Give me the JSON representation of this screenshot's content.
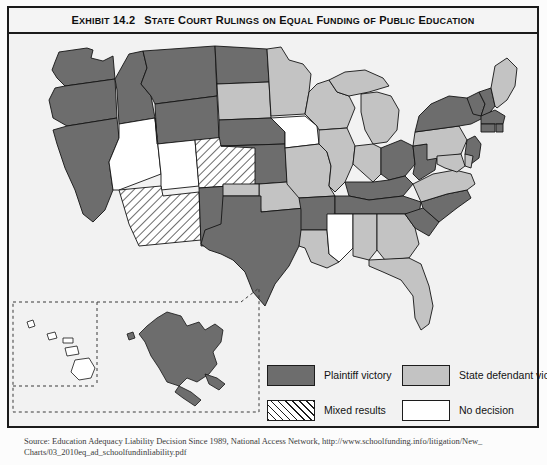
{
  "exhibit": {
    "number_label": "Exhibit 14.2",
    "title": "State Court Rulings on Equal Funding of Public Education"
  },
  "legend": {
    "items": [
      {
        "key": "plaintiff",
        "label": "Plaintiff victory",
        "style": "solid-dark",
        "color": "#6d6d6d"
      },
      {
        "key": "state_defendant",
        "label": "State defendant victory",
        "style": "solid-light",
        "color": "#c3c3c3"
      },
      {
        "key": "mixed",
        "label": "Mixed results",
        "style": "hatched",
        "color": "#ffffff"
      },
      {
        "key": "no_decision",
        "label": "No decision",
        "style": "solid-white",
        "color": "#ffffff"
      }
    ]
  },
  "source": {
    "line1": "Source: Education Adequacy Liability Decision Since 1989, National Access Network, http://www.schoolfunding.info/litigation/New_",
    "line2": "Charts/03_2010eq_ad_schoolfundinliability.pdf"
  },
  "chart_data": {
    "type": "map",
    "title": "State Court Rulings on Equal Funding of Public Education",
    "categories": [
      "Plaintiff victory",
      "State defendant victory",
      "Mixed results",
      "No decision"
    ],
    "category_colors": {
      "Plaintiff victory": "#6d6d6d",
      "State defendant victory": "#c3c3c3",
      "Mixed results": "#ffffff",
      "No decision": "#ffffff"
    },
    "values": {
      "WA": "Plaintiff victory",
      "OR": "Plaintiff victory",
      "CA": "Plaintiff victory",
      "ID": "Plaintiff victory",
      "MT": "Plaintiff victory",
      "WY": "Plaintiff victory",
      "NV": "No decision",
      "UT": "No decision",
      "AZ": "Mixed results",
      "CO": "Mixed results",
      "NM": "Plaintiff victory",
      "ND": "Plaintiff victory",
      "SD": "State defendant victory",
      "NE": "Plaintiff victory",
      "KS": "Plaintiff victory",
      "OK": "State defendant victory",
      "TX": "Plaintiff victory",
      "MN": "State defendant victory",
      "IA": "No decision",
      "MO": "State defendant victory",
      "AR": "Plaintiff victory",
      "LA": "State defendant victory",
      "WI": "State defendant victory",
      "IL": "State defendant victory",
      "MS": "No decision",
      "MI": "State defendant victory",
      "IN": "State defendant victory",
      "KY": "Plaintiff victory",
      "TN": "Plaintiff victory",
      "AL": "State defendant victory",
      "OH": "Plaintiff victory",
      "GA": "State defendant victory",
      "FL": "State defendant victory",
      "SC": "Plaintiff victory",
      "NC": "Plaintiff victory",
      "VA": "State defendant victory",
      "WV": "Plaintiff victory",
      "PA": "State defendant victory",
      "NY": "Plaintiff victory",
      "VT": "Plaintiff victory",
      "NH": "Plaintiff victory",
      "ME": "State defendant victory",
      "MA": "Plaintiff victory",
      "CT": "Plaintiff victory",
      "RI": "Plaintiff victory",
      "NJ": "Plaintiff victory",
      "DE": "State defendant victory",
      "MD": "State defendant victory",
      "AK": "Plaintiff victory",
      "HI": "No decision"
    },
    "legend_position": "bottom"
  }
}
